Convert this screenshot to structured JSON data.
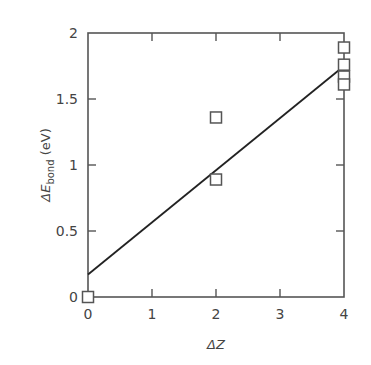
{
  "chart_data": {
    "type": "scatter",
    "title": "",
    "xlabel": "ΔZ",
    "ylabel": "ΔE_bond (eV)",
    "ylabel_parts": {
      "delta_e": "ΔE",
      "subscript": "bond",
      "unit": " (eV)"
    },
    "xlim": [
      0,
      4
    ],
    "ylim": [
      0,
      2
    ],
    "x_ticks": [
      0,
      1,
      2,
      3,
      4
    ],
    "x_tick_labels": [
      "0",
      "1",
      "2",
      "3",
      "4"
    ],
    "y_ticks": [
      0,
      0.5,
      1,
      1.5,
      2
    ],
    "y_tick_labels": [
      "0",
      "0.5",
      "1",
      "1.5",
      "2"
    ],
    "grid": false,
    "legend": null,
    "series": [
      {
        "name": "data",
        "marker": "open-square",
        "points": [
          {
            "x": 0,
            "y": 0.0
          },
          {
            "x": 2,
            "y": 1.36
          },
          {
            "x": 2,
            "y": 0.89
          },
          {
            "x": 4,
            "y": 1.89
          },
          {
            "x": 4,
            "y": 1.76
          },
          {
            "x": 4,
            "y": 1.67
          },
          {
            "x": 4,
            "y": 1.61
          }
        ]
      },
      {
        "name": "linear fit",
        "style": "line",
        "points": [
          {
            "x": 0,
            "y": 0.17
          },
          {
            "x": 4,
            "y": 1.75
          }
        ]
      }
    ],
    "colors": {
      "axis": "#555555",
      "marker": "#555555",
      "line": "#222222"
    }
  }
}
